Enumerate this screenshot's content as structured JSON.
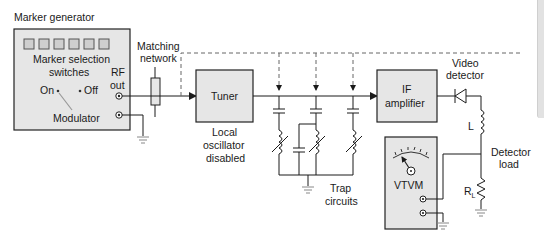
{
  "diagram": {
    "title": "Marker generator",
    "colors": {
      "box_fill": "#e6e6e6",
      "box_stroke": "#222222",
      "dashed": "#666666",
      "wire": "#1a1a1a",
      "edge_tab": "#e2e2e2"
    },
    "marker_generator": {
      "title": "Marker generator",
      "switches_label_1": "Marker selection",
      "switches_label_2": "switches",
      "switch_count": 6,
      "on_label": "On",
      "off_label": "Off",
      "modulator_label": "Modulator",
      "rf_out_1": "RF",
      "rf_out_2": "out"
    },
    "matching_network": {
      "line1": "Matching",
      "line2": "network"
    },
    "tuner": {
      "label": "Tuner",
      "note1": "Local",
      "note2": "oscillator",
      "note3": "disabled"
    },
    "trap_circuits": {
      "line1": "Trap",
      "line2": "circuits",
      "count": 3
    },
    "if_amplifier": {
      "line1": "IF",
      "line2": "amplifier"
    },
    "video_detector": {
      "line1": "Video",
      "line2": "detector"
    },
    "inductor_label": "L",
    "detector_load": {
      "line1": "Detector",
      "line2": "load",
      "resistor": "R",
      "resistor_sub": "L"
    },
    "vtvm": {
      "label": "VTVM"
    }
  }
}
